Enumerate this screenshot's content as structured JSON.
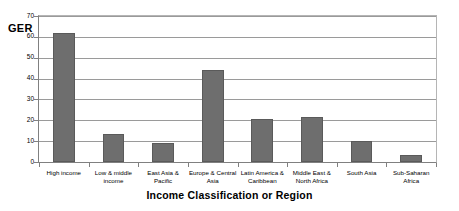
{
  "chart_data": {
    "type": "bar",
    "title": "",
    "xlabel": "Income Classification or Region",
    "ylabel": "GER",
    "ylim": [
      0,
      70
    ],
    "ytick_step": 10,
    "yticks": [
      0,
      10,
      20,
      30,
      40,
      50,
      60,
      70
    ],
    "grid": true,
    "legend": false,
    "legend_position": "none",
    "bar_color": "#6e6e6e",
    "categories": [
      "High income",
      "Low & middle income",
      "East Asia & Pacific",
      "Europe & Central Asia",
      "Latin America & Caribbean",
      "Middle East & North Africa",
      "South Asia",
      "Sub-Saharan Africa"
    ],
    "values": [
      62,
      13.5,
      9,
      44,
      20.5,
      21.5,
      10,
      3.5
    ]
  },
  "axis": {
    "y_title": "GER",
    "x_title": "Income Classification or Region"
  },
  "category_labels": [
    {
      "line1": "High income",
      "line2": ""
    },
    {
      "line1": "Low & middle",
      "line2": "income"
    },
    {
      "line1": "East Asia &",
      "line2": "Pacific"
    },
    {
      "line1": "Europe & Central",
      "line2": "Asia"
    },
    {
      "line1": "Latin America &",
      "line2": "Caribbean"
    },
    {
      "line1": "Middle East &",
      "line2": "North Africa"
    },
    {
      "line1": "South Asia",
      "line2": ""
    },
    {
      "line1": "Sub-Saharan",
      "line2": "Africa"
    }
  ],
  "ytick_labels": [
    "0",
    "10",
    "20",
    "30",
    "40",
    "50",
    "60",
    "70"
  ]
}
